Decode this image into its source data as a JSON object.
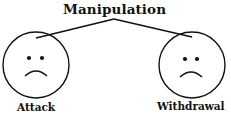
{
  "diagram": {
    "title": "Manipulation",
    "branches": [
      {
        "label": "Attack",
        "face": "sad-face-icon"
      },
      {
        "label": "Withdrawal",
        "face": "sad-face-icon"
      }
    ],
    "colors": {
      "stroke": "#111111",
      "background": "#ffffff"
    }
  }
}
